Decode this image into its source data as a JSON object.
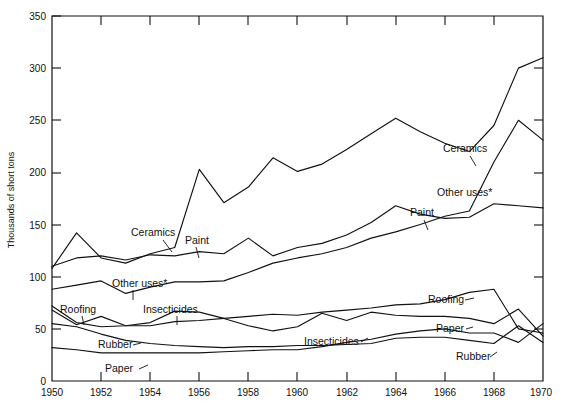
{
  "chart_data": {
    "type": "line",
    "title": "",
    "xlabel": "",
    "ylabel": "Thousands of short tons",
    "xlim": [
      1950,
      1970
    ],
    "ylim": [
      0,
      350
    ],
    "ytick_values": [
      0,
      50,
      100,
      150,
      200,
      250,
      300,
      350
    ],
    "ytick_labels": [
      "0",
      "50",
      "100",
      "150",
      "200",
      "250",
      "300",
      "350"
    ],
    "xtick_values": [
      1950,
      1952,
      1954,
      1956,
      1958,
      1960,
      1962,
      1964,
      1966,
      1968,
      1970
    ],
    "xtick_labels": [
      "1950",
      "1952",
      "1954",
      "1956",
      "1958",
      "1960",
      "1962",
      "1964",
      "1966",
      "1968",
      "1970"
    ],
    "xminor_values": [
      1951,
      1953,
      1955,
      1957,
      1959,
      1961,
      1963,
      1965,
      1967,
      1969
    ],
    "grid": false,
    "legend": "inline-annotations",
    "x": [
      1950,
      1951,
      1952,
      1953,
      1954,
      1955,
      1956,
      1957,
      1958,
      1959,
      1960,
      1961,
      1962,
      1963,
      1964,
      1965,
      1966,
      1967,
      1968,
      1969,
      1970
    ],
    "series": [
      {
        "name": "Ceramics",
        "label": "Ceramics",
        "values": [
          108,
          142,
          118,
          113,
          122,
          128,
          203,
          171,
          186,
          214,
          201,
          208,
          222,
          237,
          252,
          239,
          228,
          220,
          245,
          300,
          310
        ]
      },
      {
        "name": "Paint",
        "label": "Paint",
        "values": [
          110,
          118,
          120,
          116,
          121,
          120,
          124,
          122,
          137,
          120,
          128,
          132,
          140,
          152,
          168,
          160,
          156,
          157,
          170,
          168,
          166
        ]
      },
      {
        "name": "Other uses*",
        "label": "Other uses*",
        "values": [
          88,
          92,
          96,
          84,
          90,
          95,
          95,
          96,
          104,
          113,
          118,
          122,
          128,
          137,
          143,
          150,
          158,
          163,
          210,
          250,
          231
        ]
      },
      {
        "name": "Roofing",
        "label": "Roofing",
        "values": [
          68,
          54,
          62,
          53,
          53,
          57,
          58,
          60,
          62,
          64,
          63,
          66,
          68,
          70,
          73,
          74,
          78,
          85,
          88,
          50,
          46
        ]
      },
      {
        "name": "Insecticides",
        "label": "Insecticides",
        "values": [
          72,
          56,
          52,
          53,
          56,
          67,
          66,
          60,
          53,
          48,
          52,
          65,
          58,
          66,
          63,
          62,
          62,
          60,
          55,
          69,
          43
        ]
      },
      {
        "name": "Rubber",
        "label": "Rubber",
        "values": [
          55,
          52,
          45,
          39,
          36,
          34,
          33,
          32,
          33,
          33,
          34,
          34,
          35,
          36,
          41,
          42,
          42,
          39,
          36,
          53,
          37
        ]
      },
      {
        "name": "Paper",
        "label": "Paper",
        "values": [
          32,
          30,
          27,
          27,
          27,
          27,
          27,
          28,
          29,
          30,
          30,
          33,
          37,
          40,
          45,
          48,
          50,
          46,
          46,
          37,
          55
        ]
      }
    ],
    "annotations": [
      {
        "text": "Ceramics",
        "near_year": 1954,
        "side": "left"
      },
      {
        "text": "Paint",
        "near_year": 1956,
        "side": "left"
      },
      {
        "text": "Other uses*",
        "near_year": 1953,
        "side": "left"
      },
      {
        "text": "Roofing",
        "near_year": 1951,
        "side": "left"
      },
      {
        "text": "Insecticides",
        "near_year": 1954,
        "side": "left"
      },
      {
        "text": "Rubber",
        "near_year": 1953,
        "side": "left"
      },
      {
        "text": "Paper",
        "near_year": 1953,
        "side": "left"
      },
      {
        "text": "Ceramics",
        "near_year": 1966,
        "side": "right"
      },
      {
        "text": "Other uses*",
        "near_year": 1966,
        "side": "right"
      },
      {
        "text": "Paint",
        "near_year": 1964,
        "side": "right"
      },
      {
        "text": "Roofing",
        "near_year": 1966,
        "side": "right"
      },
      {
        "text": "Insecticides",
        "near_year": 1962,
        "side": "right"
      },
      {
        "text": "Paper",
        "near_year": 1967,
        "side": "right"
      },
      {
        "text": "Rubber",
        "near_year": 1967,
        "side": "right"
      }
    ]
  },
  "labels": {
    "y_axis_title": "Thousands of short tons",
    "ceramics_left": "Ceramics",
    "paint_left": "Paint",
    "other_uses_left": "Other  uses*",
    "roofing_left": "Roofing",
    "insecticides_left": "Insecticides",
    "rubber_left": "Rubber",
    "paper_left": "Paper",
    "ceramics_right": "Ceramics",
    "other_uses_right": "Other uses*",
    "paint_right": "Paint",
    "roofing_right": "Roofing",
    "insecticides_right": "Insecticides",
    "paper_right": "Paper",
    "rubber_right": "Rubber"
  },
  "yticks": [
    "350",
    "300",
    "250",
    "200",
    "150",
    "100",
    "50",
    "0"
  ],
  "xticks": [
    "1950",
    "1952",
    "1954",
    "1956",
    "1958",
    "1960",
    "1962",
    "1964",
    "1966",
    "1968",
    "1970"
  ],
  "colors": {
    "line": "#111111",
    "axis": "#111111",
    "background": "#ffffff"
  }
}
